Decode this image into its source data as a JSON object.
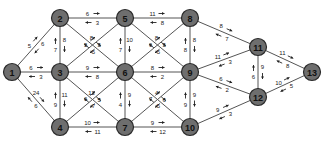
{
  "diagram": {
    "type": "directed-weighted-network",
    "nodes": [
      {
        "id": "1",
        "x": 12,
        "y": 72
      },
      {
        "id": "2",
        "x": 60,
        "y": 18
      },
      {
        "id": "3",
        "x": 60,
        "y": 72
      },
      {
        "id": "4",
        "x": 60,
        "y": 127
      },
      {
        "id": "5",
        "x": 125,
        "y": 18
      },
      {
        "id": "6",
        "x": 125,
        "y": 72
      },
      {
        "id": "7",
        "x": 125,
        "y": 127
      },
      {
        "id": "8",
        "x": 190,
        "y": 18
      },
      {
        "id": "9",
        "x": 190,
        "y": 72
      },
      {
        "id": "10",
        "x": 190,
        "y": 127
      },
      {
        "id": "11",
        "x": 258,
        "y": 47
      },
      {
        "id": "12",
        "x": 258,
        "y": 97
      },
      {
        "id": "13",
        "x": 312,
        "y": 72
      }
    ],
    "edges": [
      {
        "a": "1",
        "b": "2",
        "fwd": "5",
        "back": "6"
      },
      {
        "a": "1",
        "b": "3",
        "fwd": "6",
        "back": "3"
      },
      {
        "a": "1",
        "b": "4",
        "fwd": "24",
        "back": "6"
      },
      {
        "a": "2",
        "b": "5",
        "fwd": "6",
        "back": "3"
      },
      {
        "a": "2",
        "b": "3",
        "fwd": "8",
        "back": "7"
      },
      {
        "a": "2",
        "b": "6",
        "fwd": "8",
        "back": "5"
      },
      {
        "a": "3",
        "b": "5",
        "fwd": "5",
        "back": "5"
      },
      {
        "a": "3",
        "b": "6",
        "fwd": "9",
        "back": "8"
      },
      {
        "a": "3",
        "b": "4",
        "fwd": "11",
        "back": "9"
      },
      {
        "a": "3",
        "b": "7",
        "fwd": "12",
        "back": "7"
      },
      {
        "a": "4",
        "b": "6",
        "fwd": "6",
        "back": "5"
      },
      {
        "a": "4",
        "b": "7",
        "fwd": "10",
        "back": "11"
      },
      {
        "a": "5",
        "b": "8",
        "fwd": "11",
        "back": "8"
      },
      {
        "a": "5",
        "b": "6",
        "fwd": "10",
        "back": "7"
      },
      {
        "a": "5",
        "b": "9",
        "fwd": "8",
        "back": "5"
      },
      {
        "a": "6",
        "b": "8",
        "fwd": "6",
        "back": "5"
      },
      {
        "a": "6",
        "b": "9",
        "fwd": "8",
        "back": "2"
      },
      {
        "a": "6",
        "b": "7",
        "fwd": "9",
        "back": "4"
      },
      {
        "a": "6",
        "b": "10",
        "fwd": "4",
        "back": "5"
      },
      {
        "a": "7",
        "b": "9",
        "fwd": "7",
        "back": "6"
      },
      {
        "a": "7",
        "b": "10",
        "fwd": "9",
        "back": "12"
      },
      {
        "a": "8",
        "b": "9",
        "fwd": "8",
        "back": "8"
      },
      {
        "a": "8",
        "b": "11",
        "fwd": "8",
        "back": "7"
      },
      {
        "a": "9",
        "b": "11",
        "fwd": "11",
        "back": "3"
      },
      {
        "a": "9",
        "b": "10",
        "fwd": "9",
        "back": "9"
      },
      {
        "a": "9",
        "b": "12",
        "fwd": "6",
        "back": "2"
      },
      {
        "a": "10",
        "b": "12",
        "fwd": "9",
        "back": "3"
      },
      {
        "a": "11",
        "b": "12",
        "fwd": "9",
        "back": "6"
      },
      {
        "a": "11",
        "b": "13",
        "fwd": "11",
        "back": "8"
      },
      {
        "a": "12",
        "b": "13",
        "fwd": "10",
        "back": "5"
      }
    ]
  }
}
